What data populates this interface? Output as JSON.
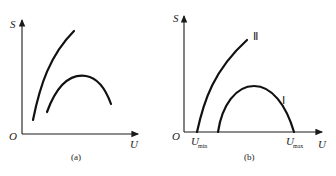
{
  "panels": [
    {
      "id": "a",
      "caption": "(a)",
      "y_axis_label": "S",
      "x_axis_label": "U",
      "origin_label": "O",
      "curves": [
        {
          "name": "rising-curve",
          "shape": "monotonic increasing, concave"
        },
        {
          "name": "hump-curve",
          "shape": "rises to a maximum then falls"
        }
      ]
    },
    {
      "id": "b",
      "caption": "(b)",
      "y_axis_label": "S",
      "x_axis_label": "U",
      "origin_label": "O",
      "x_marks": [
        {
          "label": "U",
          "subscript": "min"
        },
        {
          "label": "U",
          "subscript": "max"
        }
      ],
      "curves": [
        {
          "name": "curve-II",
          "label": "Ⅱ",
          "shape": "starts at U_min, monotonic increasing"
        },
        {
          "name": "curve-I",
          "label": "Ⅰ",
          "shape": "parabola-like hump ending at U_max"
        }
      ]
    }
  ]
}
